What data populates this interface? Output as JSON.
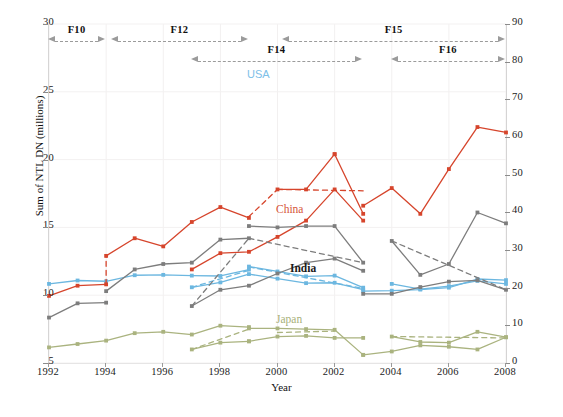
{
  "chart_data": {
    "type": "line",
    "title": "",
    "xlabel": "Year",
    "ylabel": "Sum of NTL DN (millions)",
    "ylabel_right": "Sum of NTL DN for USA (millions)",
    "xlim": [
      1992,
      2008
    ],
    "ylim": [
      5,
      30
    ],
    "ylim_right": [
      0,
      90
    ],
    "grid": true,
    "legend_position": "inline-labels",
    "xticks": [
      1992,
      1994,
      1996,
      1998,
      2000,
      2002,
      2004,
      2006,
      2008
    ],
    "yticks_left": [
      5,
      10,
      15,
      20,
      25,
      30
    ],
    "yticks_right": [
      0,
      10,
      20,
      30,
      40,
      50,
      60,
      70,
      80,
      90
    ],
    "annotations": [
      {
        "label": "F10",
        "x_start": 1992.0,
        "x_end": 1994.0,
        "row": 0
      },
      {
        "label": "F12",
        "x_start": 1994.2,
        "x_end": 1999.0,
        "row": 0
      },
      {
        "label": "F14",
        "x_start": 1997.0,
        "x_end": 2003.0,
        "row": 1
      },
      {
        "label": "F15",
        "x_start": 2000.2,
        "x_end": 2008.0,
        "row": 0
      },
      {
        "label": "F16",
        "x_start": 2004.0,
        "x_end": 2008.0,
        "row": 1
      }
    ],
    "series": [
      {
        "name": "USA",
        "axis": "right",
        "color": "#6cb7e0",
        "segments": [
          {
            "style": "solid",
            "x": [
              1992,
              1993,
              1994,
              1995,
              1996,
              1997,
              1998,
              1999
            ],
            "y": [
              21.0,
              21.9,
              21.7,
              23.3,
              23.4,
              23.2,
              23.1,
              24.8
            ]
          },
          {
            "style": "solid",
            "x": [
              1997,
              1998,
              1999,
              2000,
              2001,
              2002,
              2003
            ],
            "y": [
              20.1,
              21.4,
              23.6,
              22.4,
              21.2,
              21.3,
              19.5
            ]
          },
          {
            "style": "dashed",
            "x": [
              1997,
              1999
            ],
            "y": [
              20.1,
              24.6
            ]
          },
          {
            "style": "solid",
            "x": [
              1999,
              2000,
              2001,
              2002,
              2003
            ],
            "y": [
              25.6,
              24.3,
              23.0,
              23.2,
              20.0
            ]
          },
          {
            "style": "dashed",
            "x": [
              1999,
              2003
            ],
            "y": [
              25.5,
              19.8
            ]
          },
          {
            "style": "solid",
            "x": [
              2003,
              2004,
              2005,
              2006,
              2007,
              2008
            ],
            "y": [
              19.1,
              19.2,
              19.5,
              20.0,
              22.3,
              22.0
            ]
          },
          {
            "style": "solid",
            "x": [
              2004,
              2005,
              2006,
              2007,
              2008
            ],
            "y": [
              21.0,
              19.6,
              20.4,
              21.8,
              21.0
            ]
          }
        ]
      },
      {
        "name": "China",
        "axis": "left",
        "color": "#d6452c",
        "segments": [
          {
            "style": "solid",
            "x": [
              1992,
              1993,
              1994
            ],
            "y": [
              9.95,
              10.7,
              10.8
            ]
          },
          {
            "style": "dashed",
            "x": [
              1994,
              1994
            ],
            "y": [
              10.8,
              12.9
            ]
          },
          {
            "style": "solid",
            "x": [
              1994,
              1995,
              1996,
              1997,
              1998,
              1999
            ],
            "y": [
              12.9,
              14.2,
              13.6,
              15.4,
              16.5,
              15.7
            ]
          },
          {
            "style": "solid",
            "x": [
              1997,
              1998,
              1999,
              2000,
              2001,
              2002,
              2003
            ],
            "y": [
              11.9,
              13.1,
              13.2,
              14.3,
              15.5,
              17.8,
              15.5
            ]
          },
          {
            "style": "dashed",
            "x": [
              1999,
              2000
            ],
            "y": [
              15.8,
              17.8
            ]
          },
          {
            "style": "solid",
            "x": [
              2000,
              2001,
              2002
            ],
            "y": [
              17.8,
              17.8,
              20.4
            ]
          },
          {
            "style": "solid",
            "x": [
              2002,
              2003
            ],
            "y": [
              20.4,
              16.0
            ]
          },
          {
            "style": "dashed",
            "x": [
              2000,
              2003
            ],
            "y": [
              17.8,
              17.7
            ]
          },
          {
            "style": "solid",
            "x": [
              2003,
              2004,
              2005,
              2006,
              2007,
              2008
            ],
            "y": [
              16.6,
              17.9,
              16.0,
              19.3,
              22.4,
              22.0
            ]
          }
        ]
      },
      {
        "name": "India",
        "axis": "left",
        "color": "#7d7d7d",
        "segments": [
          {
            "style": "solid",
            "x": [
              1992,
              1993,
              1994
            ],
            "y": [
              8.35,
              9.4,
              9.45
            ]
          },
          {
            "style": "solid",
            "x": [
              1994,
              1995,
              1996,
              1997,
              1998,
              1999
            ],
            "y": [
              10.3,
              11.9,
              12.3,
              12.4,
              14.1,
              14.2
            ]
          },
          {
            "style": "solid",
            "x": [
              1997,
              1998,
              1999,
              2000,
              2001,
              2002,
              2003
            ],
            "y": [
              9.2,
              10.4,
              10.7,
              11.6,
              12.4,
              12.7,
              11.8
            ]
          },
          {
            "style": "dashed",
            "x": [
              1997,
              1999
            ],
            "y": [
              9.2,
              14.2
            ]
          },
          {
            "style": "solid",
            "x": [
              1999,
              2000,
              2001,
              2002,
              2003
            ],
            "y": [
              15.1,
              15.0,
              15.1,
              15.1,
              12.4
            ]
          },
          {
            "style": "dashed",
            "x": [
              1999,
              2003
            ],
            "y": [
              14.2,
              12.4
            ]
          },
          {
            "style": "solid",
            "x": [
              2003,
              2004,
              2005,
              2006,
              2007,
              2008
            ],
            "y": [
              10.1,
              10.1,
              10.6,
              11.0,
              11.1,
              10.4
            ]
          },
          {
            "style": "solid",
            "x": [
              2004,
              2005,
              2006,
              2007,
              2008
            ],
            "y": [
              14.0,
              11.5,
              12.3,
              16.1,
              15.3
            ]
          },
          {
            "style": "dashed",
            "x": [
              2004,
              2008
            ],
            "y": [
              14.0,
              10.4
            ]
          }
        ]
      },
      {
        "name": "Japan",
        "axis": "left",
        "color": "#aab37f",
        "segments": [
          {
            "style": "solid",
            "x": [
              1992,
              1993,
              1994,
              1995,
              1996,
              1997,
              1998,
              1999
            ],
            "y": [
              6.15,
              6.4,
              6.65,
              7.2,
              7.3,
              7.1,
              7.75,
              7.65
            ]
          },
          {
            "style": "solid",
            "x": [
              1997,
              1998,
              1999
            ],
            "y": [
              6.0,
              6.5,
              6.6
            ]
          },
          {
            "style": "dashed",
            "x": [
              1997,
              1999
            ],
            "y": [
              6.0,
              7.5
            ]
          },
          {
            "style": "solid",
            "x": [
              1999,
              2000,
              2001,
              2002,
              2003
            ],
            "y": [
              7.55,
              7.55,
              7.5,
              7.45,
              5.6
            ]
          },
          {
            "style": "solid",
            "x": [
              1999,
              2000,
              2001,
              2002,
              2003
            ],
            "y": [
              6.6,
              6.95,
              7.0,
              6.85,
              6.85
            ]
          },
          {
            "style": "dashed",
            "x": [
              2000,
              2002
            ],
            "y": [
              7.25,
              7.35
            ]
          },
          {
            "style": "solid",
            "x": [
              2003,
              2004,
              2005,
              2006,
              2007,
              2008
            ],
            "y": [
              5.6,
              5.85,
              6.3,
              6.2,
              6.0,
              6.9
            ]
          },
          {
            "style": "solid",
            "x": [
              2004,
              2005,
              2006,
              2007,
              2008
            ],
            "y": [
              6.95,
              6.55,
              6.5,
              7.3,
              6.9
            ]
          },
          {
            "style": "dashed",
            "x": [
              2004,
              2008
            ],
            "y": [
              6.95,
              6.85
            ]
          }
        ]
      }
    ]
  }
}
